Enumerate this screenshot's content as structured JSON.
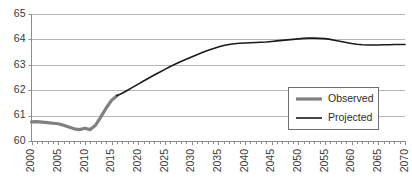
{
  "chart_data": {
    "type": "line",
    "title": "",
    "subtitle": "",
    "xlabel": "",
    "ylabel": "",
    "xlim": [
      2000,
      2070
    ],
    "ylim": [
      60,
      65
    ],
    "grid": true,
    "grid_axis": "y",
    "legend_position": "center-right",
    "y_ticks": [
      60,
      61,
      62,
      63,
      64,
      65
    ],
    "y_tick_labels": [
      "60",
      "61",
      "62",
      "63",
      "64",
      "65"
    ],
    "x_ticks": [
      2000,
      2005,
      2010,
      2015,
      2020,
      2025,
      2030,
      2035,
      2040,
      2045,
      2050,
      2055,
      2060,
      2065,
      2070
    ],
    "x_tick_labels": [
      "2000",
      "2005",
      "2010",
      "2015",
      "2020",
      "2025",
      "2030",
      "2035",
      "2040",
      "2045",
      "2050",
      "2055",
      "2060",
      "2065",
      "2070"
    ],
    "x_minor_tick_step": 1,
    "x_tick_label_rotation": -90,
    "series": [
      {
        "name": "Observed",
        "color": "#808080",
        "width": 3.2,
        "x": [
          2000,
          2001,
          2002,
          2003,
          2004,
          2005,
          2006,
          2007,
          2008,
          2009,
          2010,
          2011,
          2012,
          2013,
          2014,
          2015,
          2016
        ],
        "values": [
          60.75,
          60.76,
          60.74,
          60.72,
          60.7,
          60.68,
          60.62,
          60.55,
          60.48,
          60.45,
          60.5,
          60.45,
          60.62,
          60.95,
          61.3,
          61.6,
          61.78
        ]
      },
      {
        "name": "Projected",
        "color": "#1a1a1a",
        "width": 1.6,
        "x": [
          2016,
          2017,
          2018,
          2019,
          2020,
          2021,
          2022,
          2023,
          2024,
          2025,
          2026,
          2027,
          2028,
          2029,
          2030,
          2031,
          2032,
          2033,
          2034,
          2035,
          2036,
          2037,
          2038,
          2039,
          2040,
          2041,
          2042,
          2043,
          2044,
          2045,
          2046,
          2047,
          2048,
          2049,
          2050,
          2051,
          2052,
          2053,
          2054,
          2055,
          2056,
          2057,
          2058,
          2059,
          2060,
          2061,
          2062,
          2063,
          2064,
          2065,
          2066,
          2067,
          2068,
          2069,
          2070
        ],
        "values": [
          61.78,
          61.88,
          62.0,
          62.12,
          62.24,
          62.36,
          62.48,
          62.6,
          62.71,
          62.82,
          62.93,
          63.03,
          63.13,
          63.22,
          63.31,
          63.4,
          63.48,
          63.56,
          63.63,
          63.7,
          63.76,
          63.8,
          63.83,
          63.85,
          63.86,
          63.87,
          63.88,
          63.89,
          63.9,
          63.92,
          63.94,
          63.96,
          63.98,
          64.0,
          64.02,
          64.04,
          64.05,
          64.05,
          64.04,
          64.03,
          64.0,
          63.96,
          63.92,
          63.88,
          63.84,
          63.81,
          63.79,
          63.78,
          63.78,
          63.78,
          63.79,
          63.79,
          63.8,
          63.8,
          63.8
        ]
      }
    ],
    "legend": [
      {
        "label": "Observed",
        "color": "#808080",
        "width": 3.2
      },
      {
        "label": "Projected",
        "color": "#1a1a1a",
        "width": 1.6
      }
    ]
  },
  "colors": {
    "observed": "#808080",
    "projected": "#1a1a1a",
    "grid": "#b6b6b6",
    "axis": "#8c8c8c",
    "text": "#3a3a3a",
    "legend_border": "#6f6f6f",
    "background": "#ffffff"
  }
}
